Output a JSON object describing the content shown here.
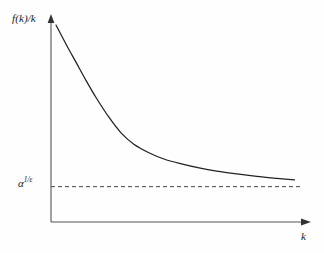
{
  "figure": {
    "background_color": "#fefefe",
    "line_color": "#222222",
    "axis_color": "#555555",
    "dash_color": "#444444"
  },
  "labels": {
    "y_axis": "f(k)/k",
    "x_axis": "k",
    "threshold_base": "α",
    "threshold_exponent": "1/ε",
    "threshold_full": "α^(1/ε)"
  },
  "chart_data": {
    "type": "line",
    "title": "",
    "xlabel": "k",
    "ylabel": "f(k)/k",
    "grid": false,
    "legend": null,
    "axis_style": "arrow-tipped open axes",
    "xlim": [
      0,
      1
    ],
    "ylim": [
      0,
      1
    ],
    "annotations": [
      {
        "text": "α^(1/ε)",
        "type": "horizontal-asymptote-label",
        "y_value": 0.175
      }
    ],
    "series": [
      {
        "name": "f(k)/k",
        "description": "Monotonically decreasing convex curve approaching the horizontal asymptote alpha^(1/epsilon) from above",
        "x": [
          0.02,
          0.06,
          0.1,
          0.14,
          0.18,
          0.23,
          0.28,
          0.33,
          0.39,
          0.45,
          0.52,
          0.59,
          0.66,
          0.74,
          0.82,
          0.9,
          0.97
        ],
        "y": [
          0.975,
          0.88,
          0.79,
          0.7,
          0.615,
          0.52,
          0.44,
          0.385,
          0.343,
          0.312,
          0.288,
          0.268,
          0.252,
          0.238,
          0.226,
          0.216,
          0.208
        ]
      },
      {
        "name": "asymptote",
        "style": "dashed",
        "description": "Horizontal dashed line at alpha^(1/epsilon)",
        "x": [
          0.0,
          1.0
        ],
        "y": [
          0.175,
          0.175
        ]
      }
    ]
  }
}
